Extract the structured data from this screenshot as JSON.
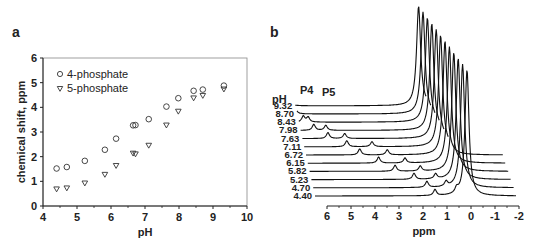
{
  "chart_data": [
    {
      "panel": "a",
      "type": "scatter",
      "title": "",
      "xlabel": "pH",
      "ylabel": "chemical shift, ppm",
      "xlim": [
        4,
        10
      ],
      "ylim": [
        0,
        6
      ],
      "xticks": [
        4,
        5,
        6,
        7,
        8,
        9,
        10
      ],
      "yticks": [
        0,
        1,
        2,
        3,
        4,
        5,
        6
      ],
      "grid": false,
      "legend_position": "upper-left",
      "series": [
        {
          "name": "4-phosphate",
          "marker": "open-circle",
          "x": [
            4.4,
            4.7,
            5.23,
            5.82,
            6.15,
            6.65,
            6.72,
            7.11,
            7.63,
            7.98,
            8.43,
            8.7,
            9.32
          ],
          "y": [
            1.52,
            1.58,
            1.83,
            2.28,
            2.73,
            3.27,
            3.28,
            3.52,
            4.03,
            4.37,
            4.67,
            4.72,
            4.88
          ]
        },
        {
          "name": "5-phosphate",
          "marker": "open-triangle-down",
          "x": [
            4.4,
            4.7,
            5.23,
            5.82,
            6.15,
            6.65,
            6.72,
            7.11,
            7.63,
            7.98,
            8.43,
            8.7,
            9.32
          ],
          "y": [
            0.68,
            0.72,
            0.92,
            1.27,
            1.63,
            2.13,
            2.1,
            2.45,
            3.27,
            3.83,
            4.37,
            4.47,
            4.73
          ]
        }
      ]
    },
    {
      "panel": "b",
      "type": "line",
      "title": "",
      "xlabel": "ppm",
      "xlim": [
        6,
        -2
      ],
      "xticks": [
        6,
        5,
        4,
        3,
        2,
        1,
        0,
        -1,
        -2
      ],
      "stack_label": "pH",
      "peak_labels": [
        "P4",
        "P5"
      ],
      "series_ph": [
        "9.32",
        "8.70",
        "8.43",
        "7.98",
        "7.63",
        "7.11",
        "6.72",
        "6.15",
        "5.82",
        "5.23",
        "4.70",
        "4.40"
      ],
      "peaks_P4_ppm": [
        6.3,
        6.1,
        5.75,
        5.45,
        5.0,
        4.35,
        3.95,
        3.3,
        2.75,
        2.1,
        1.7,
        1.5
      ],
      "peaks_P5_ppm": [
        6.1,
        5.95,
        5.55,
        4.95,
        4.3,
        3.3,
        2.8,
        2.2,
        1.7,
        1.2,
        0.9,
        0.6
      ],
      "reference_peak_ppm": 0
    }
  ],
  "panel_a": {
    "label": "a",
    "ylabel": "chemical shift, ppm",
    "xlabel": "pH",
    "legend": [
      "4-phosphate",
      "5-phosphate"
    ],
    "xticks": [
      "4",
      "5",
      "6",
      "7",
      "8",
      "9",
      "10"
    ],
    "yticks": [
      "0",
      "1",
      "2",
      "3",
      "4",
      "5",
      "6"
    ]
  },
  "panel_b": {
    "label": "b",
    "stack_label": "pH",
    "peak_label_p4": "P4",
    "peak_label_p5": "P5",
    "xlabel": "ppm",
    "xticks": [
      "6",
      "5",
      "4",
      "3",
      "2",
      "1",
      "0",
      "-1",
      "-2"
    ],
    "ph_labels": [
      "9.32",
      "8.70",
      "8.43",
      "7.98",
      "7.63",
      "7.11",
      "6.72",
      "6.15",
      "5.82",
      "5.23",
      "4.70",
      "4.40"
    ]
  }
}
